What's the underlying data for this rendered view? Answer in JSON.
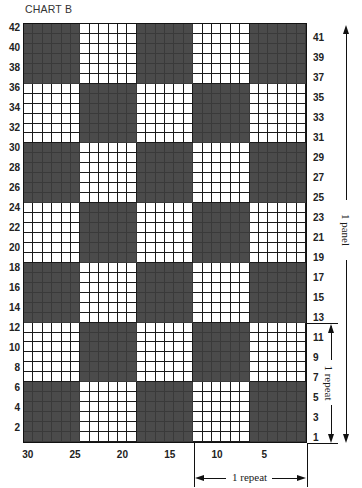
{
  "title": "CHART B",
  "chart_data": {
    "type": "knitting-chart",
    "title": "CHART B",
    "stitches": 30,
    "rows": 42,
    "block_size": [
      6,
      6
    ],
    "column_labels": [
      30,
      25,
      20,
      15,
      10,
      5
    ],
    "left_row_labels": [
      42,
      40,
      38,
      36,
      34,
      32,
      30,
      28,
      26,
      24,
      22,
      20,
      18,
      16,
      14,
      12,
      10,
      8,
      6,
      4,
      2
    ],
    "right_row_labels": [
      41,
      39,
      37,
      35,
      33,
      31,
      29,
      27,
      25,
      23,
      21,
      19,
      17,
      15,
      13,
      11,
      9,
      7,
      5,
      3,
      1
    ],
    "block_pattern_top_to_bottom": [
      [
        "dark",
        "light",
        "dark",
        "light",
        "dark"
      ],
      [
        "light",
        "dark",
        "light",
        "dark",
        "light"
      ],
      [
        "dark",
        "light",
        "dark",
        "light",
        "dark"
      ],
      [
        "light",
        "dark",
        "light",
        "dark",
        "light"
      ],
      [
        "dark",
        "light",
        "dark",
        "light",
        "dark"
      ],
      [
        "light",
        "dark",
        "light",
        "dark",
        "light"
      ],
      [
        "dark",
        "light",
        "dark",
        "light",
        "dark"
      ]
    ],
    "colors": {
      "dark": "#4b4b4b",
      "light": "#ffffff",
      "grid": "#1a1a1a"
    },
    "annotations": {
      "panel": {
        "label": "1 panel",
        "rows": [
          1,
          42
        ]
      },
      "vertical_repeat": {
        "label": "1 repeat",
        "rows": [
          1,
          12
        ]
      },
      "horizontal_repeat": {
        "label": "1 repeat",
        "stitches": [
          1,
          12
        ]
      }
    }
  },
  "labels": {
    "panel": "1 panel",
    "vrepeat": "1 repeat",
    "hrepeat": "1 repeat"
  }
}
